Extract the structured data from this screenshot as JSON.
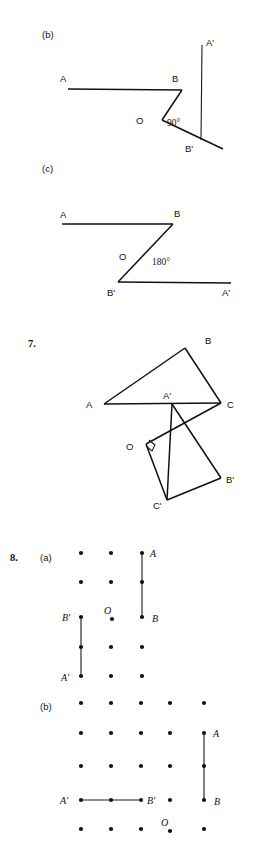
{
  "page": {
    "background": "#ffffff",
    "ink": "#111111",
    "width": 261,
    "height": 858
  },
  "figures": [
    {
      "id": "fig-b",
      "part_label": "(b)",
      "part_label_pos": [
        42,
        35
      ],
      "type": "rotation-diagram",
      "angle_label": "90°",
      "angle_label_pos": [
        168,
        122
      ],
      "points": {
        "A": {
          "label": "A",
          "label_pos": [
            62,
            79
          ],
          "at": [
            68,
            89
          ]
        },
        "B": {
          "label": "B",
          "label_pos": [
            172,
            79
          ],
          "at": [
            182,
            90
          ]
        },
        "O": {
          "label": "O",
          "label_pos": [
            140,
            121
          ],
          "at": [
            162,
            120
          ]
        },
        "A_prime": {
          "label": "A'",
          "label_pos": [
            205,
            43
          ],
          "at": [
            202,
            50
          ]
        },
        "B_prime": {
          "label": "B'",
          "label_pos": [
            186,
            150
          ],
          "at": [
            201,
            139
          ]
        }
      },
      "segments": [
        {
          "name": "segment-AB",
          "from": [
            68,
            89
          ],
          "to": [
            182,
            90
          ]
        },
        {
          "name": "segment-B-to-O",
          "from": [
            182,
            90
          ],
          "to": [
            162,
            120
          ]
        },
        {
          "name": "segment-O-to-Bprime-ray",
          "from": [
            162,
            120
          ],
          "to": [
            223,
            148
          ]
        },
        {
          "name": "segment-Aprime-vertical",
          "from": [
            202,
            45
          ],
          "to": [
            201,
            140
          ]
        }
      ]
    },
    {
      "id": "fig-c",
      "part_label": "(c)",
      "part_label_pos": [
        42,
        169
      ],
      "type": "rotation-diagram",
      "angle_label": "180°",
      "angle_label_pos": [
        160,
        260
      ],
      "points": {
        "A": {
          "label": "A",
          "label_pos": [
            62,
            214
          ],
          "at": [
            62,
            224
          ]
        },
        "B": {
          "label": "B",
          "label_pos": [
            176,
            213
          ],
          "at": [
            173,
            224
          ]
        },
        "O": {
          "label": "O",
          "label_pos": [
            121,
            256
          ],
          "at": [
            140,
            252
          ]
        },
        "B_prime": {
          "label": "B'",
          "label_pos": [
            108,
            300
          ],
          "at": [
            118,
            282
          ]
        },
        "A_prime": {
          "label": "A'",
          "label_pos": [
            222,
            300
          ],
          "at": [
            231,
            283
          ]
        }
      },
      "segments": [
        {
          "name": "segment-AB",
          "from": [
            62,
            224
          ],
          "to": [
            173,
            224
          ]
        },
        {
          "name": "segment-B-to-Bprime",
          "from": [
            173,
            224
          ],
          "to": [
            118,
            282
          ]
        },
        {
          "name": "segment-Bprime-to-Aprime",
          "from": [
            118,
            282
          ],
          "to": [
            231,
            283
          ]
        }
      ]
    },
    {
      "id": "fig-7",
      "number_label": "7.",
      "number_label_pos": [
        31,
        344
      ],
      "type": "rotation-triangle-diagram",
      "right_angle_marker_at": [
        145,
        443
      ],
      "points": {
        "A": {
          "label": "A",
          "label_pos": [
            88,
            407
          ],
          "at": [
            104,
            404
          ]
        },
        "B": {
          "label": "B",
          "label_pos": [
            208,
            340
          ],
          "at": [
            185,
            348
          ]
        },
        "C": {
          "label": "C",
          "label_pos": [
            228,
            406
          ],
          "at": [
            221,
            403
          ]
        },
        "A_prime": {
          "label": "A'",
          "label_pos": [
            165,
            396
          ],
          "at": [
            172,
            404
          ]
        },
        "O": {
          "label": "O",
          "label_pos": [
            128,
            448
          ],
          "at": [
            146,
            444
          ]
        },
        "B_prime": {
          "label": "B'",
          "label_pos": [
            227,
            482
          ],
          "at": [
            221,
            478
          ]
        },
        "C_prime": {
          "label": "C'",
          "label_pos": [
            155,
            507
          ],
          "at": [
            167,
            500
          ]
        }
      },
      "segments": [
        {
          "name": "triangle-side-AB",
          "from": [
            104,
            404
          ],
          "to": [
            185,
            348
          ]
        },
        {
          "name": "triangle-side-BC",
          "from": [
            185,
            348
          ],
          "to": [
            221,
            403
          ]
        },
        {
          "name": "triangle-side-CA",
          "from": [
            221,
            403
          ],
          "to": [
            104,
            404
          ]
        },
        {
          "name": "image-side-Aprime-Bprime",
          "from": [
            172,
            404
          ],
          "to": [
            221,
            478
          ]
        },
        {
          "name": "image-side-Bprime-Cprime",
          "from": [
            221,
            478
          ],
          "to": [
            167,
            500
          ]
        },
        {
          "name": "image-side-Cprime-Aprime",
          "from": [
            167,
            500
          ],
          "to": [
            172,
            404
          ]
        },
        {
          "name": "ray-O-to-C",
          "from": [
            146,
            444
          ],
          "to": [
            221,
            403
          ]
        },
        {
          "name": "ray-O-to-Cprime",
          "from": [
            146,
            444
          ],
          "to": [
            167,
            500
          ]
        }
      ]
    },
    {
      "id": "fig-8a",
      "number_label": "8.",
      "number_label_pos": [
        12,
        557
      ],
      "part_label": "(a)",
      "part_label_pos": [
        42,
        557
      ],
      "type": "dot-grid-diagram",
      "grid": {
        "cols_x": [
          81,
          111,
          142
        ],
        "rows_y": [
          553,
          582,
          617,
          647,
          676
        ],
        "dot_radius": 2.1
      },
      "points": {
        "A": {
          "label": "A",
          "label_pos": [
            151,
            556
          ],
          "at": [
            142,
            553
          ]
        },
        "B": {
          "label": "B",
          "label_pos": [
            153,
            621
          ],
          "at": [
            142,
            617
          ]
        },
        "B_prime": {
          "label": "B'",
          "label_pos": [
            64,
            620
          ],
          "at": [
            81,
            617
          ]
        },
        "A_prime": {
          "label": "A'",
          "label_pos": [
            63,
            680
          ],
          "at": [
            81,
            676
          ]
        },
        "O": {
          "label": "O",
          "label_pos": [
            106,
            613
          ],
          "at": [
            112,
            618
          ]
        }
      },
      "segments": [
        {
          "name": "segment-AB",
          "from": [
            142,
            553
          ],
          "to": [
            142,
            617
          ]
        },
        {
          "name": "segment-Bprime-Aprime",
          "from": [
            81,
            617
          ],
          "to": [
            81,
            676
          ]
        }
      ]
    },
    {
      "id": "fig-8b",
      "part_label": "(b)",
      "part_label_pos": [
        42,
        707
      ],
      "type": "dot-grid-diagram",
      "grid": {
        "cols_x": [
          81,
          111,
          141,
          170,
          204
        ],
        "rows_y": [
          703,
          733,
          766,
          800,
          829
        ],
        "dot_radius": 2.1
      },
      "points": {
        "A": {
          "label": "A",
          "label_pos": [
            215,
            736
          ],
          "at": [
            204,
            733
          ]
        },
        "B": {
          "label": "B",
          "label_pos": [
            216,
            804
          ],
          "at": [
            204,
            800
          ]
        },
        "A_prime": {
          "label": "A'",
          "label_pos": [
            62,
            804
          ],
          "at": [
            81,
            800
          ]
        },
        "B_prime": {
          "label": "B'",
          "label_pos": [
            148,
            804
          ],
          "at": [
            141,
            800
          ]
        },
        "O": {
          "label": "O",
          "label_pos": [
            163,
            824
          ],
          "at": [
            170,
            829
          ]
        }
      },
      "segments": [
        {
          "name": "segment-AB",
          "from": [
            204,
            733
          ],
          "to": [
            204,
            800
          ]
        },
        {
          "name": "segment-Aprime-Bprime",
          "from": [
            81,
            800
          ],
          "to": [
            141,
            800
          ]
        }
      ]
    }
  ]
}
